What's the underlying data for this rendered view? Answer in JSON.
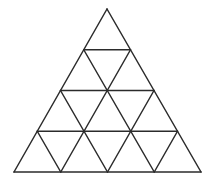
{
  "diagram": {
    "type": "triangular-grid",
    "rows": 4,
    "small_triangle_count": 16,
    "apex": [
      107,
      9
    ],
    "base_left": [
      14,
      172
    ],
    "base_right": [
      201,
      172
    ],
    "stroke_color": "#2b2b2b",
    "stroke_width": 1.5,
    "background": "#ffffff"
  }
}
